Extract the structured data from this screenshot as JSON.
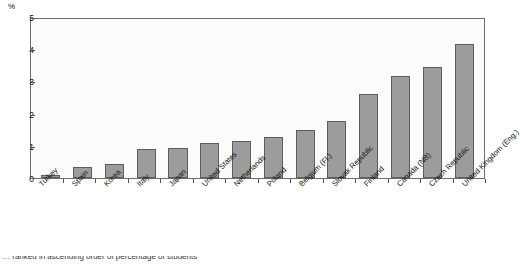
{
  "chart_data": {
    "type": "bar",
    "title": "",
    "xlabel": "",
    "ylabel": "%",
    "ylim": [
      0,
      5
    ],
    "yticks": [
      0,
      1,
      2,
      3,
      4,
      5
    ],
    "grid": false,
    "legend": "none",
    "categories": [
      "Turkey",
      "Spain",
      "Korea",
      "Italy",
      "Japan",
      "United States",
      "Netherlands",
      "Poland",
      "Belgium (Fl.)",
      "Slovak Republic",
      "Finland",
      "Canada (NB)",
      "Czech Republic",
      "United Kingdom (Eng.)"
    ],
    "values": [
      0.1,
      0.35,
      0.45,
      0.9,
      0.95,
      1.1,
      1.15,
      1.3,
      1.5,
      1.8,
      2.65,
      3.2,
      3.5,
      4.2
    ],
    "bar_color": "#9c9c9c",
    "bar_border_color": "#5d5d5d"
  },
  "caption": {
    "text": "… ranked in ascending order of percentage of students"
  }
}
